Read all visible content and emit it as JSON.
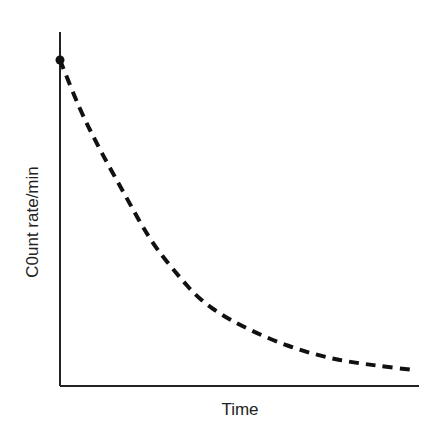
{
  "chart_data": {
    "type": "line",
    "title": "",
    "xlabel": "Time",
    "ylabel": "C0unt rate/min",
    "grid": false,
    "legend": null,
    "series": [
      {
        "name": "decay",
        "style": "dashed",
        "color": "#111111",
        "points_px": [
          [
            60,
            60
          ],
          [
            80,
            110
          ],
          [
            100,
            150
          ],
          [
            125,
            195
          ],
          [
            150,
            240
          ],
          [
            175,
            272
          ],
          [
            200,
            300
          ],
          [
            225,
            317
          ],
          [
            250,
            330
          ],
          [
            275,
            341
          ],
          [
            300,
            350
          ],
          [
            325,
            357
          ],
          [
            350,
            362
          ],
          [
            380,
            366
          ],
          [
            413,
            370
          ]
        ]
      }
    ],
    "start_marker": {
      "x": 60,
      "y": 60,
      "shape": "dot"
    },
    "axes": {
      "origin": [
        60,
        386
      ],
      "x_end": 419,
      "y_top": 32
    }
  }
}
